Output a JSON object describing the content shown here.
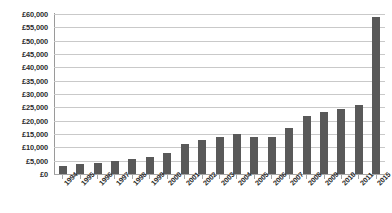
{
  "chart_data": {
    "type": "bar",
    "title": "",
    "subtitle": "",
    "xlabel": "",
    "ylabel": "",
    "categories": [
      "1994",
      "1995",
      "1996",
      "1997",
      "1998",
      "1999",
      "2000",
      "2001",
      "2002",
      "2003",
      "2004",
      "2005",
      "2006",
      "2007",
      "2008",
      "2009",
      "2010",
      "2011",
      "2015"
    ],
    "values": [
      2900,
      3900,
      4100,
      4800,
      5500,
      6500,
      7900,
      11100,
      12800,
      13800,
      14900,
      13800,
      13900,
      17400,
      21800,
      23100,
      24500,
      25800,
      58700
    ],
    "ylim": [
      0,
      60000
    ],
    "ytick_values": [
      0,
      5000,
      10000,
      15000,
      20000,
      25000,
      30000,
      35000,
      40000,
      45000,
      50000,
      55000,
      60000
    ],
    "ytick_labels": [
      "£0",
      "£5,000",
      "£10,000",
      "£15,000",
      "£20,000",
      "£25,000",
      "£30,000",
      "£35,000",
      "£40,000",
      "£45,000",
      "£50,000",
      "£55,000",
      "£60,000"
    ],
    "grid": true,
    "legend": false,
    "legend_position": "none",
    "series": [
      {
        "name": "",
        "color": "#595959",
        "values": [
          2900,
          3900,
          4100,
          4800,
          5500,
          6500,
          7900,
          11100,
          12800,
          13800,
          14900,
          13800,
          13900,
          17400,
          21800,
          23100,
          24500,
          25800,
          58700
        ]
      }
    ]
  },
  "colors": {
    "bar": "#595959",
    "gridline": "#c9c9c9",
    "axis": "#9a9a9a",
    "text": "#2b2b2b",
    "background": "#ffffff"
  }
}
